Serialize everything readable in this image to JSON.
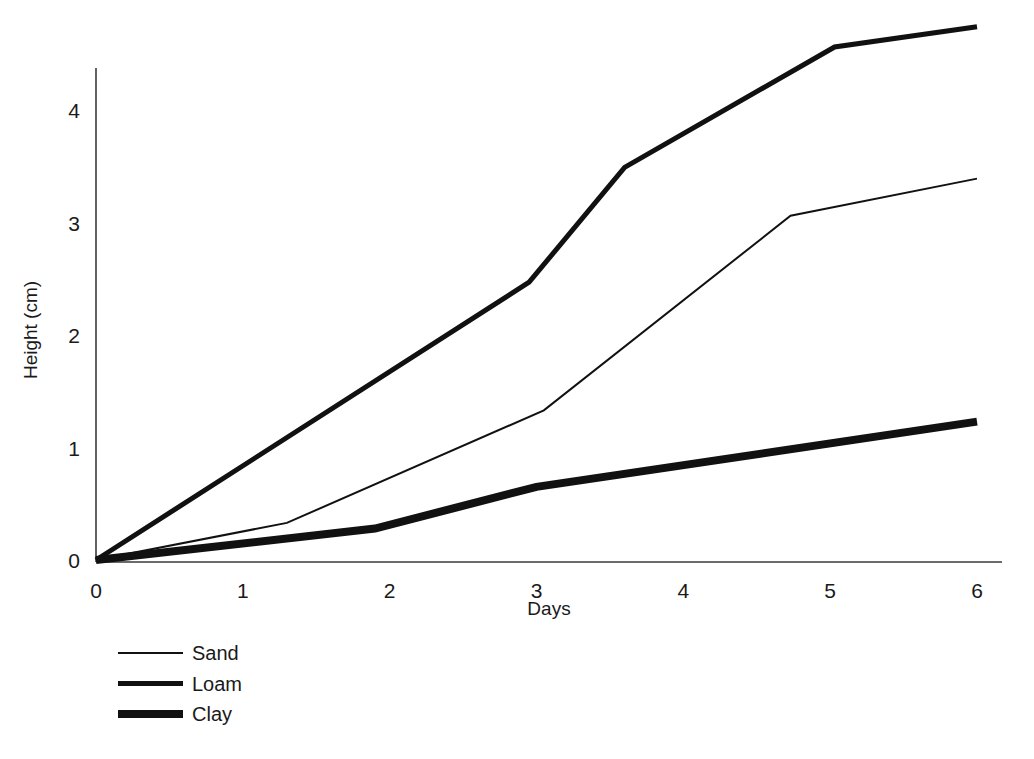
{
  "chart_data": {
    "type": "line",
    "title": "",
    "xlabel": "Days",
    "ylabel": "Height (cm)",
    "xlim": [
      0,
      6
    ],
    "ylim": [
      0,
      4.8
    ],
    "xticks": [
      0,
      1,
      2,
      3,
      4,
      5,
      6
    ],
    "xtick_labels": [
      "0",
      "1",
      "2",
      "3",
      "4",
      "5",
      "6"
    ],
    "yticks": [
      0,
      1,
      2,
      3,
      4
    ],
    "ytick_labels": [
      "0",
      "1",
      "2",
      "3",
      "4"
    ],
    "grid": false,
    "legend_position": "below-left",
    "line_color": "#111111",
    "series": [
      {
        "name": "Sand",
        "style": "thin",
        "stroke_width": 2,
        "x": [
          0,
          1.3,
          3.05,
          4.73,
          6
        ],
        "values": [
          0,
          0.33,
          1.33,
          3.06,
          3.39
        ]
      },
      {
        "name": "Loam",
        "style": "medium",
        "stroke_width": 5,
        "x": [
          0,
          2.95,
          3.6,
          5.03,
          6
        ],
        "values": [
          0,
          2.47,
          3.49,
          4.56,
          4.74
        ]
      },
      {
        "name": "Clay",
        "style": "thick",
        "stroke_width": 8,
        "x": [
          0,
          1.9,
          3.0,
          6
        ],
        "values": [
          0,
          0.28,
          0.65,
          1.23
        ]
      }
    ]
  },
  "legend": {
    "items": [
      {
        "label": "Sand",
        "stroke_width": 2
      },
      {
        "label": "Loam",
        "stroke_width": 5
      },
      {
        "label": "Clay",
        "stroke_width": 8
      }
    ]
  }
}
